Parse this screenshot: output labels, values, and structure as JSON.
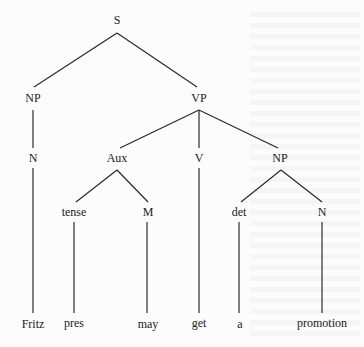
{
  "diagram": {
    "type": "syntax-tree",
    "nodes": [
      {
        "id": "S",
        "label": "S",
        "x": 117,
        "y": 20
      },
      {
        "id": "NP1",
        "label": "NP",
        "x": 33,
        "y": 98
      },
      {
        "id": "VP",
        "label": "VP",
        "x": 199,
        "y": 98
      },
      {
        "id": "N1",
        "label": "N",
        "x": 33,
        "y": 158
      },
      {
        "id": "Aux",
        "label": "Aux",
        "x": 117,
        "y": 158
      },
      {
        "id": "V",
        "label": "V",
        "x": 199,
        "y": 158
      },
      {
        "id": "NP2",
        "label": "NP",
        "x": 280,
        "y": 158
      },
      {
        "id": "tense",
        "label": "tense",
        "x": 74,
        "y": 212
      },
      {
        "id": "M",
        "label": "M",
        "x": 148,
        "y": 212
      },
      {
        "id": "det",
        "label": "det",
        "x": 239,
        "y": 212
      },
      {
        "id": "N2",
        "label": "N",
        "x": 322,
        "y": 212
      },
      {
        "id": "Fritz",
        "label": "Fritz",
        "x": 33,
        "y": 324
      },
      {
        "id": "pres",
        "label": "pres",
        "x": 74,
        "y": 323
      },
      {
        "id": "may",
        "label": "may",
        "x": 148,
        "y": 324
      },
      {
        "id": "get",
        "label": "get",
        "x": 199,
        "y": 323
      },
      {
        "id": "a",
        "label": "a",
        "x": 240,
        "y": 324
      },
      {
        "id": "promotion",
        "label": "promotion",
        "x": 322,
        "y": 323
      }
    ],
    "edges": [
      {
        "from": "S",
        "to": "NP1",
        "x1": 117,
        "y1": 33,
        "x2": 34,
        "y2": 87
      },
      {
        "from": "S",
        "to": "VP",
        "x1": 117,
        "y1": 33,
        "x2": 197,
        "y2": 87
      },
      {
        "from": "NP1",
        "to": "N1",
        "x1": 33,
        "y1": 110,
        "x2": 33,
        "y2": 148
      },
      {
        "from": "VP",
        "to": "Aux",
        "x1": 199,
        "y1": 110,
        "x2": 120,
        "y2": 148
      },
      {
        "from": "VP",
        "to": "V",
        "x1": 199,
        "y1": 110,
        "x2": 199,
        "y2": 148
      },
      {
        "from": "VP",
        "to": "NP2",
        "x1": 199,
        "y1": 110,
        "x2": 278,
        "y2": 148
      },
      {
        "from": "Aux",
        "to": "tense",
        "x1": 117,
        "y1": 170,
        "x2": 76,
        "y2": 202
      },
      {
        "from": "Aux",
        "to": "M",
        "x1": 117,
        "y1": 170,
        "x2": 148,
        "y2": 202
      },
      {
        "from": "NP2",
        "to": "det",
        "x1": 281,
        "y1": 170,
        "x2": 241,
        "y2": 202
      },
      {
        "from": "NP2",
        "to": "N2",
        "x1": 281,
        "y1": 170,
        "x2": 322,
        "y2": 202
      },
      {
        "from": "N1",
        "to": "Fritz",
        "x1": 33,
        "y1": 168,
        "x2": 33,
        "y2": 313
      },
      {
        "from": "tense",
        "to": "pres",
        "x1": 74,
        "y1": 222,
        "x2": 74,
        "y2": 313
      },
      {
        "from": "M",
        "to": "may",
        "x1": 147,
        "y1": 222,
        "x2": 147,
        "y2": 313
      },
      {
        "from": "V",
        "to": "get",
        "x1": 199,
        "y1": 168,
        "x2": 199,
        "y2": 313
      },
      {
        "from": "det",
        "to": "a",
        "x1": 239,
        "y1": 222,
        "x2": 239,
        "y2": 313
      },
      {
        "from": "N2",
        "to": "promotion",
        "x1": 322,
        "y1": 222,
        "x2": 322,
        "y2": 313
      }
    ]
  },
  "labels": {
    "S": "S",
    "NP1": "NP",
    "VP": "VP",
    "N1": "N",
    "Aux": "Aux",
    "V": "V",
    "NP2": "NP",
    "tense": "tense",
    "M": "M",
    "det": "det",
    "N2": "N",
    "Fritz": "Fritz",
    "pres": "pres",
    "may": "may",
    "get": "get",
    "a": "a",
    "promotion": "promotion"
  },
  "colors": {
    "line": "#2a2a2a",
    "text": "#222222",
    "background": "#fcfcfc"
  }
}
